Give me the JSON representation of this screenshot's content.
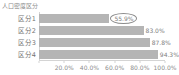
{
  "chart_data": {
    "type": "bar",
    "orientation": "horizontal",
    "title": "人口密度区分",
    "categories": [
      "区分1",
      "区分2",
      "区分3",
      "区分4"
    ],
    "values": [
      55.9,
      83.0,
      87.8,
      94.3
    ],
    "value_labels": [
      "55.9%",
      "83.0%",
      "87.8%",
      "94.3%"
    ],
    "highlight": {
      "category": "区分1",
      "label": "55.9%",
      "style": "ellipse-outline"
    },
    "x_ticks": [
      "20.0%",
      "40.0%",
      "60.0%",
      "80.0%",
      "100.0%"
    ],
    "x_tick_positions": [
      20,
      40,
      60,
      80,
      100
    ],
    "xlim": [
      0,
      100
    ],
    "grid": false,
    "legend": false,
    "colors": {
      "bar": "#b5b5b5",
      "value_text": "#808080",
      "category_text": "#737373",
      "axis_line": "#d4d4d4",
      "tick_text": "#8c8c8c",
      "ellipse_stroke": "#8c8c8c",
      "background": "#ffffff"
    }
  }
}
